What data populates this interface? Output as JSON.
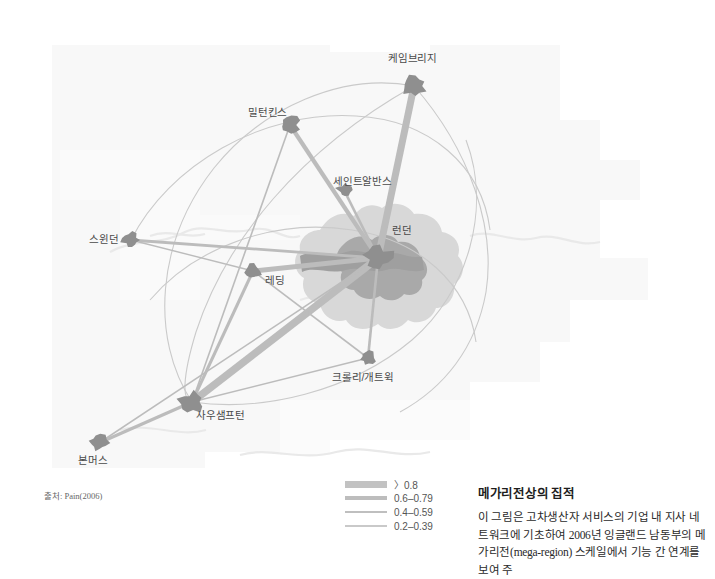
{
  "figure": {
    "source_note": "출처: Pain(2006)"
  },
  "map": {
    "nodes": [
      {
        "id": "cambridge",
        "label": "케임브리지",
        "x": 414,
        "y": 86,
        "label_x": 388,
        "label_y": 50,
        "size": 11
      },
      {
        "id": "milton",
        "label": "밀턴킨스",
        "x": 290,
        "y": 125,
        "label_x": 248,
        "label_y": 104,
        "size": 10
      },
      {
        "id": "stalbans",
        "label": "세인트알반스",
        "x": 344,
        "y": 190,
        "label_x": 333,
        "label_y": 173,
        "size": 7
      },
      {
        "id": "london",
        "label": "런던",
        "x": 378,
        "y": 258,
        "label_x": 392,
        "label_y": 222,
        "size": 14
      },
      {
        "id": "swindon",
        "label": "스윈던",
        "x": 131,
        "y": 240,
        "label_x": 89,
        "label_y": 231,
        "size": 9
      },
      {
        "id": "reading",
        "label": "레딩",
        "x": 253,
        "y": 271,
        "label_x": 265,
        "label_y": 272,
        "size": 8
      },
      {
        "id": "crawley",
        "label": "크롤리/개트윅",
        "x": 368,
        "y": 358,
        "label_x": 332,
        "label_y": 369,
        "size": 8
      },
      {
        "id": "southampton",
        "label": "사우샘프턴",
        "x": 192,
        "y": 402,
        "label_x": 196,
        "label_y": 407,
        "size": 12
      },
      {
        "id": "bournemouth",
        "label": "본머스",
        "x": 99,
        "y": 443,
        "label_x": 78,
        "label_y": 452,
        "size": 9
      }
    ],
    "links": [
      {
        "from": "london",
        "to": "cambridge",
        "weight": ">0.8",
        "width": 7.0
      },
      {
        "from": "london",
        "to": "southampton",
        "weight": ">0.8",
        "width": 7.5
      },
      {
        "from": "london",
        "to": "reading",
        "weight": "0.6-0.79",
        "width": 5.0
      },
      {
        "from": "london",
        "to": "milton",
        "weight": "0.6-0.79",
        "width": 4.2
      },
      {
        "from": "london",
        "to": "crawley",
        "weight": "0.4-0.59",
        "width": 2.6
      },
      {
        "from": "london",
        "to": "stalbans",
        "weight": "0.4-0.59",
        "width": 2.6
      },
      {
        "from": "london",
        "to": "swindon",
        "weight": "0.4-0.59",
        "width": 2.8
      },
      {
        "from": "reading",
        "to": "southampton",
        "weight": "0.4-0.59",
        "width": 3.0
      },
      {
        "from": "reading",
        "to": "swindon",
        "weight": "0.2-0.39",
        "width": 1.4
      },
      {
        "from": "reading",
        "to": "crawley",
        "weight": "0.2-0.39",
        "width": 1.6
      },
      {
        "from": "southampton",
        "to": "bournemouth",
        "weight": "0.4-0.59",
        "width": 3.2
      },
      {
        "from": "southampton",
        "to": "crawley",
        "weight": "0.2-0.39",
        "width": 1.6
      },
      {
        "from": "milton",
        "to": "southampton",
        "weight": "0.2-0.39",
        "width": 1.6
      },
      {
        "from": "london",
        "to": "bournemouth",
        "weight": "0.2-0.39",
        "width": 1.5
      }
    ]
  },
  "legend": {
    "items": [
      {
        "label": "〉0.8",
        "weight_class": "w1"
      },
      {
        "label": "0.6–0.79",
        "weight_class": "w2"
      },
      {
        "label": "0.4–0.59",
        "weight_class": "w3"
      },
      {
        "label": "0.2–0.39",
        "weight_class": "w4"
      }
    ]
  },
  "caption": {
    "title": "메가리전상의 집적",
    "body": "이 그림은 고차생산자 서비스의 기업 내 지사 네트워크에 기초하여 2006년 잉글랜드 남동부의 메가리전(mega-region) 스케일에서 기능 간 연계를 보여 주"
  },
  "colors": {
    "link": "#bcbcbc",
    "node": "#8f8f8f",
    "london_metro": "#d6d6d6",
    "london_core": "#a8a8a8",
    "arc": "#c8c8c8",
    "background_panel": "#f7f7f7"
  }
}
